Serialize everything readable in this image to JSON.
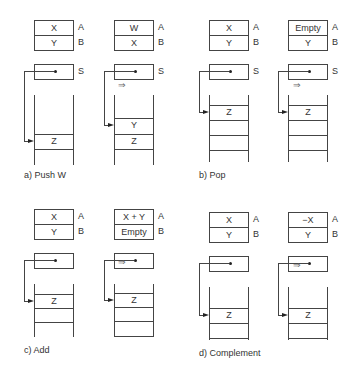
{
  "panels": [
    {
      "caption": "a)  Push  W",
      "before": {
        "A": "X",
        "B": "Y",
        "stack": [
          "Z"
        ]
      },
      "after": {
        "A": "W",
        "B": "X",
        "stack": [
          "Y",
          "Z"
        ]
      }
    },
    {
      "caption": "b)  Pop",
      "before": {
        "A": "X",
        "B": "Y",
        "stack": [
          "Z",
          "",
          ""
        ]
      },
      "after": {
        "A": "Empty",
        "B": "Y",
        "stack": [
          "Z",
          "",
          ""
        ]
      }
    },
    {
      "caption": "c)  Add",
      "before": {
        "A": "X",
        "B": "Y",
        "stack": [
          "Z",
          ""
        ]
      },
      "after": {
        "A": "X + Y",
        "B": "Empty",
        "stack": [
          "Z",
          ""
        ]
      }
    },
    {
      "caption": "d)  Complement",
      "before": {
        "A": "X",
        "B": "Y",
        "stack": [
          "Z"
        ]
      },
      "after": {
        "A": "−X",
        "B": "Y",
        "stack": [
          "Z"
        ]
      }
    }
  ],
  "labels": {
    "reg_a": "A",
    "reg_b": "B",
    "stack_pointer": "S",
    "transition": "⇒"
  }
}
